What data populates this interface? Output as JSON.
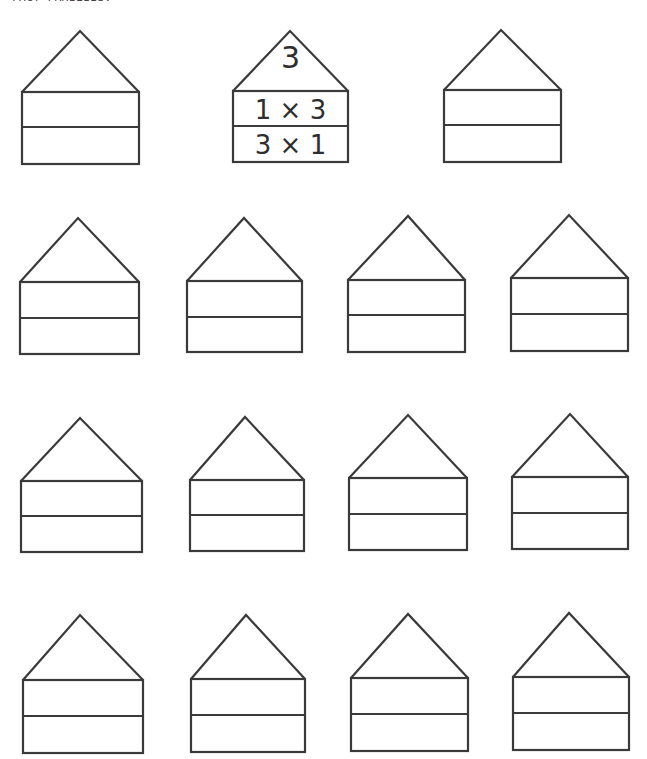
{
  "heading": {
    "text": "FACT FAMILIES:"
  },
  "example_house": {
    "roof": "3",
    "row1": "1 × 3",
    "row2": "3 × 1"
  },
  "houses": [
    {
      "x1": 22,
      "x2": 139,
      "apex": [
        80,
        31
      ],
      "roof_y": 92,
      "mid_y": 127,
      "bottom_y": 164,
      "roof": "",
      "row1": "",
      "row2": ""
    },
    {
      "x1": 233,
      "x2": 348,
      "apex": [
        290,
        31
      ],
      "roof_y": 91,
      "mid_y": 126,
      "bottom_y": 162,
      "roof": "3",
      "row1": "1 × 3",
      "row2": "3 × 1",
      "example": true
    },
    {
      "x1": 444,
      "x2": 561,
      "apex": [
        501,
        30
      ],
      "roof_y": 90,
      "mid_y": 125,
      "bottom_y": 162,
      "roof": "",
      "row1": "",
      "row2": ""
    },
    {
      "x1": 20,
      "x2": 139,
      "apex": [
        78,
        218
      ],
      "roof_y": 282,
      "mid_y": 318,
      "bottom_y": 354,
      "roof": "",
      "row1": "",
      "row2": ""
    },
    {
      "x1": 187,
      "x2": 302,
      "apex": [
        244,
        218
      ],
      "roof_y": 281,
      "mid_y": 317,
      "bottom_y": 352,
      "roof": "",
      "row1": "",
      "row2": ""
    },
    {
      "x1": 348,
      "x2": 465,
      "apex": [
        408,
        216
      ],
      "roof_y": 280,
      "mid_y": 315,
      "bottom_y": 352,
      "roof": "",
      "row1": "",
      "row2": ""
    },
    {
      "x1": 511,
      "x2": 628,
      "apex": [
        569,
        215
      ],
      "roof_y": 278,
      "mid_y": 314,
      "bottom_y": 351,
      "roof": "",
      "row1": "",
      "row2": ""
    },
    {
      "x1": 21,
      "x2": 142,
      "apex": [
        80,
        418
      ],
      "roof_y": 481,
      "mid_y": 516,
      "bottom_y": 552,
      "roof": "",
      "row1": "",
      "row2": ""
    },
    {
      "x1": 190,
      "x2": 304,
      "apex": [
        245,
        417
      ],
      "roof_y": 480,
      "mid_y": 515,
      "bottom_y": 551,
      "roof": "",
      "row1": "",
      "row2": ""
    },
    {
      "x1": 349,
      "x2": 467,
      "apex": [
        408,
        415
      ],
      "roof_y": 478,
      "mid_y": 514,
      "bottom_y": 550,
      "roof": "",
      "row1": "",
      "row2": ""
    },
    {
      "x1": 512,
      "x2": 628,
      "apex": [
        570,
        414
      ],
      "roof_y": 477,
      "mid_y": 513,
      "bottom_y": 549,
      "roof": "",
      "row1": "",
      "row2": ""
    },
    {
      "x1": 23,
      "x2": 143,
      "apex": [
        80,
        615
      ],
      "roof_y": 680,
      "mid_y": 716,
      "bottom_y": 753,
      "roof": "",
      "row1": "",
      "row2": ""
    },
    {
      "x1": 191,
      "x2": 305,
      "apex": [
        246,
        615
      ],
      "roof_y": 679,
      "mid_y": 715,
      "bottom_y": 752,
      "roof": "",
      "row1": "",
      "row2": ""
    },
    {
      "x1": 351,
      "x2": 468,
      "apex": [
        408,
        614
      ],
      "roof_y": 678,
      "mid_y": 714,
      "bottom_y": 751,
      "roof": "",
      "row1": "",
      "row2": ""
    },
    {
      "x1": 513,
      "x2": 629,
      "apex": [
        569,
        613
      ],
      "roof_y": 677,
      "mid_y": 713,
      "bottom_y": 750,
      "roof": "",
      "row1": "",
      "row2": ""
    }
  ]
}
